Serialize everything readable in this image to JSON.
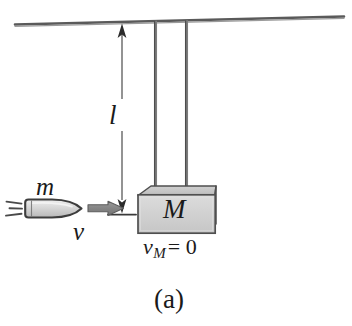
{
  "figure": {
    "caption": "(a)",
    "labels": {
      "bullet_mass": "m",
      "bullet_velocity": "v",
      "string_length": "l",
      "block_mass": "M",
      "block_velocity_symbol": "v",
      "block_velocity_subscript": "M",
      "block_velocity_value": "= 0"
    },
    "colors": {
      "ink": "#1a1a1a",
      "line": "#4a4a4a",
      "block_face": "#d2d2d2",
      "block_top": "#bfbfbf",
      "block_side": "#c4c4c4",
      "arrow_gray": "#8a8a8a",
      "bullet_fill": "#d8d8d8",
      "background": "#ffffff"
    },
    "parts": {
      "ceiling": "ceiling-line",
      "string_left": "pendulum-string-left",
      "string_right": "pendulum-string-right",
      "block": "pendulum-block",
      "bullet": "bullet",
      "speed_lines": "motion-speed-lines",
      "velocity_arrow": "velocity-arrow",
      "dimension_line": "length-dimension-line"
    }
  }
}
